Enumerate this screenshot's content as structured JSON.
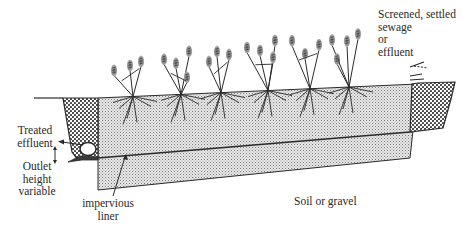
{
  "diagram": {
    "labels": {
      "inlet": [
        "Screened, settled",
        "sewage",
        "or",
        "effluent"
      ],
      "outlet": [
        "Treated",
        "effluent"
      ],
      "outlet_height": [
        "Outlet",
        "height",
        "variable"
      ],
      "liner": [
        "impervious",
        "liner"
      ],
      "ground": [
        "Soil or gravel"
      ]
    },
    "components": [
      "inlet-gravel-zone",
      "treatment-bed-media",
      "outlet-gravel-zone",
      "outlet-pipe",
      "impervious-liner",
      "reed-plants"
    ],
    "plant_count": 6,
    "colors": {
      "line": "#2a2a2a",
      "bed_fill": "#d9d9d9",
      "gravel_fill": "#6a6a6a",
      "plant_head": "#8a8a8a",
      "background": "#ffffff"
    }
  }
}
